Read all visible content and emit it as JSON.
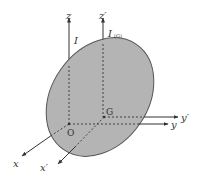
{
  "diagram": {
    "title": "",
    "colors": {
      "body_fill": "#b4b4b4",
      "body_stroke": "#555555",
      "axis": "#333333",
      "text": "#333333"
    },
    "body": {
      "cx": 100,
      "cy": 97,
      "rx": 64,
      "ry": 48,
      "rotate": -55
    },
    "points": {
      "O": {
        "label": "O",
        "x": 69,
        "y": 124
      },
      "G": {
        "label": "G",
        "x": 104,
        "y": 117
      }
    },
    "axes": {
      "z": {
        "label": "z",
        "moment_label": "I"
      },
      "z_prime": {
        "label": "z′",
        "moment_label": "I",
        "moment_subscript": "(G)"
      },
      "y": {
        "label": "y"
      },
      "y_prime": {
        "label": "y′"
      },
      "x": {
        "label": "x"
      },
      "x_prime": {
        "label": "x′"
      }
    }
  }
}
